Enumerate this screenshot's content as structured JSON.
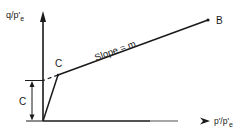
{
  "diagram": {
    "type": "geotechnical failure envelope (q/p' vs p'/p'e)",
    "y_axis_label": "q/p'",
    "y_axis_sub": "e",
    "x_axis_label": "p'/p'",
    "x_axis_sub": "e",
    "point_b_label": "B",
    "point_c_label": "C",
    "slope_label": "Slope = m",
    "intercept_label": "C",
    "colors": {
      "line": "#1a1a1a",
      "background": "#ffffff"
    }
  }
}
